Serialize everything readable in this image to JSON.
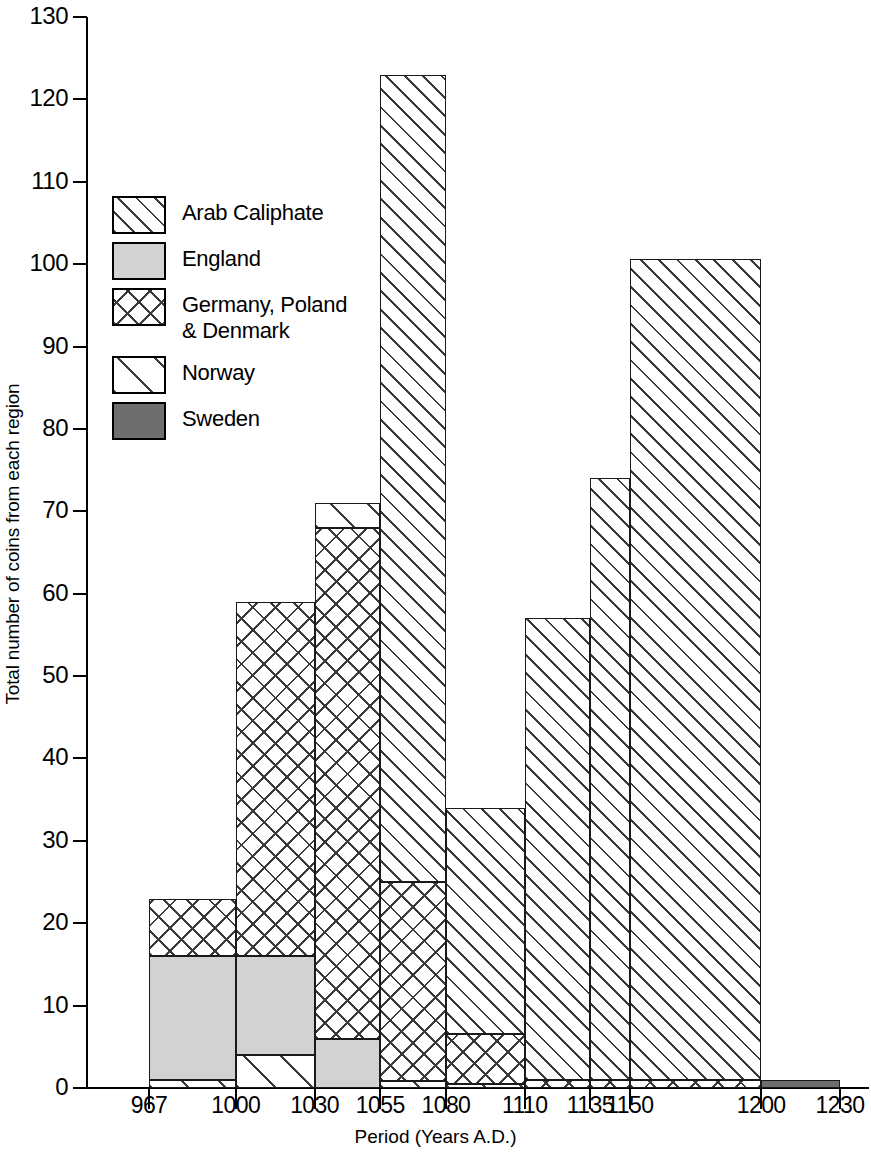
{
  "chart_data": {
    "type": "bar",
    "subtype": "stacked-bar-histogram",
    "title": "",
    "xlabel": "Period (Years A.D.)",
    "ylabel": "Total number of coins from each region",
    "ylim": [
      0,
      130
    ],
    "yticks": [
      0,
      10,
      20,
      30,
      40,
      50,
      60,
      70,
      80,
      90,
      100,
      110,
      120,
      130
    ],
    "ytick_labels": [
      "0",
      "10",
      "20",
      "30",
      "40",
      "50",
      "60",
      "70",
      "80",
      "90",
      "100",
      "110",
      "120",
      "130"
    ],
    "x_boundaries": [
      967,
      1000,
      1030,
      1055,
      1080,
      1110,
      1135,
      1150,
      1200,
      1230
    ],
    "xtick_labels": [
      "967",
      "1000",
      "1030",
      "1055",
      "1080",
      "1110",
      "1135",
      "1150",
      "1200",
      "1230"
    ],
    "grid": false,
    "legend_position": "upper-left-inside",
    "series": [
      {
        "name": "Arab Caliphate",
        "pattern": "dense-diagonal-hatch",
        "color": "#ffffff",
        "values": [
          0,
          0,
          0,
          52,
          27.5,
          56,
          73,
          100,
          0
        ]
      },
      {
        "name": "England",
        "pattern": "solid-light-gray",
        "color": "#d2d2d2",
        "values": [
          15,
          12,
          6,
          0,
          0,
          0,
          0,
          0,
          0
        ]
      },
      {
        "name": "Germany, Poland\n& Denmark",
        "pattern": "crosshatch",
        "color": "#ffffff",
        "values": [
          7,
          43,
          62,
          19,
          6,
          0.8,
          0.7,
          0.6,
          0
        ]
      },
      {
        "name": "Norway",
        "pattern": "sparse-diagonal-hatch",
        "color": "#ffffff",
        "values": [
          1,
          4,
          0.7,
          3,
          0.5,
          0.2,
          0.3,
          0,
          0
        ]
      },
      {
        "name": "Sweden",
        "pattern": "solid-dark-gray",
        "color": "#6e6e6e",
        "values": [
          0,
          0,
          0,
          0,
          0,
          0,
          0,
          0,
          1
        ]
      }
    ],
    "bar_totals": [
      23,
      59,
      68.7,
      74,
      34,
      57,
      74,
      100.6,
      1
    ],
    "bars": [
      {
        "range": "967-1000",
        "x0": 967,
        "x1": 1000,
        "total": 23,
        "segments": [
          {
            "region": "Norway",
            "from": 0,
            "to": 1
          },
          {
            "region": "England",
            "from": 1,
            "to": 16
          },
          {
            "region": "Germany, Poland & Denmark",
            "from": 16,
            "to": 23
          }
        ]
      },
      {
        "range": "1000-1030",
        "x0": 1000,
        "x1": 1030,
        "total": 59,
        "segments": [
          {
            "region": "Norway",
            "from": 0,
            "to": 4
          },
          {
            "region": "England",
            "from": 4,
            "to": 16
          },
          {
            "region": "Germany, Poland & Denmark",
            "from": 16,
            "to": 59
          }
        ]
      },
      {
        "range": "1030-1055",
        "x0": 1030,
        "x1": 1055,
        "total": 71,
        "segments": [
          {
            "region": "England",
            "from": 0,
            "to": 6
          },
          {
            "region": "Germany, Poland & Denmark",
            "from": 6,
            "to": 68
          },
          {
            "region": "Norway",
            "from": 68,
            "to": 71
          }
        ]
      },
      {
        "range": "1055-1080",
        "x0": 1055,
        "x1": 1080,
        "total": 123,
        "segments": [
          {
            "region": "Norway",
            "from": 0,
            "to": 0.8
          },
          {
            "region": "Germany, Poland & Denmark",
            "from": 0.8,
            "to": 25
          },
          {
            "region": "Arab Caliphate",
            "from": 25,
            "to": 123
          }
        ]
      },
      {
        "range": "1080-1110",
        "x0": 1080,
        "x1": 1110,
        "total": 34,
        "segments": [
          {
            "region": "Norway",
            "from": 0,
            "to": 0.5
          },
          {
            "region": "Germany, Poland & Denmark",
            "from": 0.5,
            "to": 6.5
          },
          {
            "region": "Arab Caliphate",
            "from": 6.5,
            "to": 34
          }
        ]
      },
      {
        "range": "1110-1135",
        "x0": 1110,
        "x1": 1135,
        "total": 57,
        "segments": [
          {
            "region": "Germany, Poland & Denmark",
            "from": 0,
            "to": 1
          },
          {
            "region": "Arab Caliphate",
            "from": 1,
            "to": 57
          }
        ]
      },
      {
        "range": "1135-1150",
        "x0": 1135,
        "x1": 1150,
        "total": 74,
        "segments": [
          {
            "region": "Germany, Poland & Denmark",
            "from": 0,
            "to": 1
          },
          {
            "region": "Arab Caliphate",
            "from": 1,
            "to": 74
          }
        ]
      },
      {
        "range": "1150-1200",
        "x0": 1150,
        "x1": 1200,
        "total": 100.6,
        "segments": [
          {
            "region": "Germany, Poland & Denmark",
            "from": 0,
            "to": 1
          },
          {
            "region": "Arab Caliphate",
            "from": 1,
            "to": 100.6
          }
        ]
      },
      {
        "range": "1200-1230",
        "x0": 1200,
        "x1": 1230,
        "total": 1,
        "segments": [
          {
            "region": "Sweden",
            "from": 0,
            "to": 1
          }
        ]
      }
    ]
  },
  "legend": {
    "items": [
      {
        "label": "Arab Caliphate",
        "pattern": "pat-arab"
      },
      {
        "label": "England",
        "pattern": "pat-england"
      },
      {
        "label": "Germany, Poland\n& Denmark",
        "pattern": "pat-germany"
      },
      {
        "label": "Norway",
        "pattern": "pat-norway"
      },
      {
        "label": "Sweden",
        "pattern": "pat-sweden"
      }
    ]
  }
}
